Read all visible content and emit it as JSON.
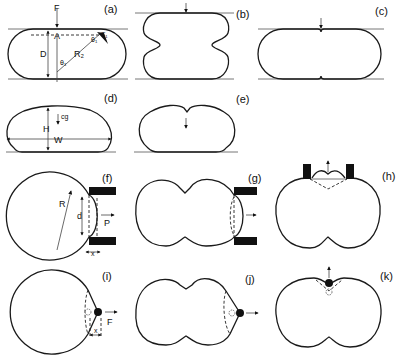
{
  "figure": {
    "panels": [
      {
        "id": "a",
        "label": "(a)",
        "annotations": {
          "force": "F",
          "contact": "A",
          "depth": "D",
          "angle": "θ₁",
          "radius": "R₂",
          "tension": "T₁",
          "angle2": "θ₁"
        }
      },
      {
        "id": "b",
        "label": "(b)"
      },
      {
        "id": "c",
        "label": "(c)"
      },
      {
        "id": "d",
        "label": "(d)",
        "annotations": {
          "center_gravity": "cg",
          "height": "H",
          "width": "W"
        }
      },
      {
        "id": "e",
        "label": "(e)"
      },
      {
        "id": "f",
        "label": "(f)",
        "annotations": {
          "radius": "R",
          "depth": "d",
          "force": "P",
          "offset": "x"
        }
      },
      {
        "id": "g",
        "label": "(g)"
      },
      {
        "id": "h",
        "label": "(h)"
      },
      {
        "id": "i",
        "label": "(i)",
        "annotations": {
          "force": "F",
          "offset": "x"
        }
      },
      {
        "id": "j",
        "label": "(j)"
      },
      {
        "id": "k",
        "label": "(k)"
      }
    ]
  }
}
